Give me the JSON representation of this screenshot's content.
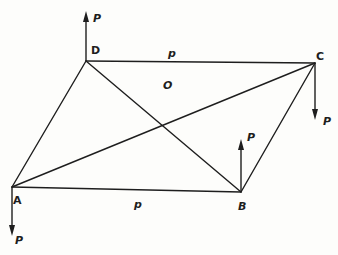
{
  "diagram": {
    "vertices": {
      "A": {
        "label": "A",
        "x": 12,
        "y": 187
      },
      "B": {
        "label": "B",
        "x": 241,
        "y": 192
      },
      "C": {
        "label": "C",
        "x": 315,
        "y": 63
      },
      "D": {
        "label": "D",
        "x": 86,
        "y": 61
      }
    },
    "center": {
      "label": "O",
      "x": 166,
      "y": 85
    },
    "edges": [
      {
        "from": "A",
        "to": "B"
      },
      {
        "from": "B",
        "to": "C"
      },
      {
        "from": "C",
        "to": "D"
      },
      {
        "from": "D",
        "to": "A"
      },
      {
        "from": "A",
        "to": "C"
      },
      {
        "from": "D",
        "to": "B"
      }
    ],
    "edge_labels": {
      "dc": "p",
      "ab": "p"
    },
    "forces": [
      {
        "at": "D",
        "direction": "up",
        "label": "P"
      },
      {
        "at": "C",
        "direction": "down",
        "label": "P"
      },
      {
        "at": "A",
        "direction": "down",
        "label": "P"
      },
      {
        "at": "B",
        "direction": "up",
        "label": "P"
      }
    ]
  }
}
